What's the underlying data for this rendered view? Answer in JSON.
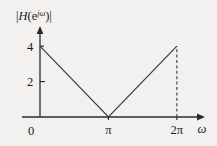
{
  "chart_data": {
    "type": "line",
    "title": "",
    "ylabel": "|H(e^{jω})|",
    "ylabel_parts": {
      "bar_open": "|",
      "h": "H",
      "paren_open": "(",
      "e": "e",
      "sup_j": "j",
      "sup_omega": "ω",
      "paren_close": ")",
      "bar_close": "|"
    },
    "xlabel": "ω",
    "xlim": [
      0,
      7.3
    ],
    "ylim": [
      0,
      4.8
    ],
    "grid": false,
    "legend": null,
    "x_tick_labels": [
      "0",
      "π",
      "2π"
    ],
    "x_tick_values": [
      0,
      3.14159,
      6.28319
    ],
    "y_tick_labels": [
      "2",
      "4"
    ],
    "y_tick_values": [
      2,
      4
    ],
    "series": [
      {
        "name": "magnitude-response",
        "style": "solid",
        "x": [
          0,
          3.14159,
          6.28319
        ],
        "values": [
          4,
          0,
          4
        ]
      }
    ],
    "annotations": [
      {
        "name": "dashed-drop-line-at-2pi",
        "style": "dashed",
        "x": 6.28319,
        "y_from": 0,
        "y_to": 4
      }
    ],
    "axis_arrows": {
      "x": "right",
      "y": "up"
    },
    "colors": {
      "background": "#f2f1ef",
      "axis": "#2b2b2b",
      "curve": "#3a3a3a",
      "text": "#1d1d1d"
    }
  }
}
